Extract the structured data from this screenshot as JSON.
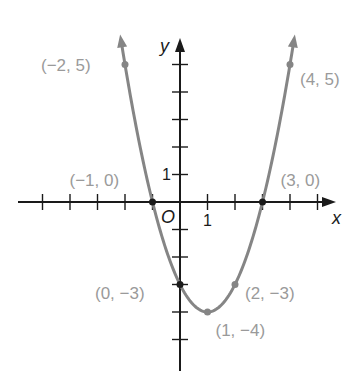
{
  "chart_data": {
    "type": "line",
    "title": "",
    "function": "y = x^2 - 2x - 3",
    "xlabel": "x",
    "ylabel": "y",
    "origin_label": "O",
    "tick_labels": {
      "x_unit": "1",
      "y_unit": "1"
    },
    "xlim": [
      -5,
      5.5
    ],
    "ylim": [
      -6,
      6
    ],
    "grid": false,
    "series": [
      {
        "name": "parabola",
        "color": "#858585",
        "x": [
          -2,
          -1,
          0,
          1,
          2,
          3,
          4
        ],
        "y": [
          5,
          0,
          -3,
          -4,
          -3,
          0,
          5
        ]
      }
    ],
    "annotations": [
      {
        "x": -2,
        "y": 5,
        "label": "(−2, 5)"
      },
      {
        "x": -1,
        "y": 0,
        "label": "(−1, 0)"
      },
      {
        "x": 0,
        "y": -3,
        "label": "(0, −3)"
      },
      {
        "x": 1,
        "y": -4,
        "label": "(1, −4)"
      },
      {
        "x": 2,
        "y": -3,
        "label": "(2, −3)"
      },
      {
        "x": 3,
        "y": 0,
        "label": "(3, 0)"
      },
      {
        "x": 4,
        "y": 5,
        "label": "(4, 5)"
      }
    ]
  },
  "colors": {
    "axis": "#1a1a1a",
    "curve": "#858585",
    "label": "#9a9a9a"
  }
}
